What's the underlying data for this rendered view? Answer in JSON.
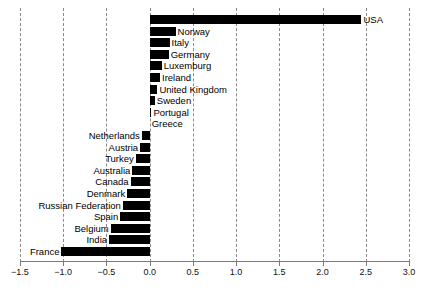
{
  "chart_data": {
    "type": "bar",
    "orientation": "horizontal",
    "title": "",
    "subtitle": "",
    "xlabel": "",
    "ylabel": "",
    "xlim": [
      -1.5,
      3.0
    ],
    "xticks": [
      -1.5,
      -1.0,
      -0.5,
      0.0,
      0.5,
      1.0,
      1.5,
      2.0,
      2.5,
      3.0
    ],
    "xticklabels": [
      "−1.5",
      "−1.0",
      "−0.5",
      "0.0",
      "0.5",
      "1.0",
      "1.5",
      "2.0",
      "2.5",
      "3.0"
    ],
    "grid": true,
    "grid_style": "dashed-vertical",
    "legend": null,
    "bar_color": "#000000",
    "categories": [
      "USA",
      "Norway",
      "Italy",
      "Germany",
      "Luxemburg",
      "Ireland",
      "United Kingdom",
      "Sweden",
      "Portugal",
      "Greece",
      "Netherlands",
      "Austria",
      "Turkey",
      "Australia",
      "Canada",
      "Denmark",
      "Russian Federation",
      "Spain",
      "Belgium",
      "India",
      "France"
    ],
    "values": [
      2.45,
      0.3,
      0.23,
      0.22,
      0.14,
      0.12,
      0.09,
      0.06,
      0.02,
      0.0,
      -0.09,
      -0.11,
      -0.16,
      -0.2,
      -0.22,
      -0.26,
      -0.31,
      -0.34,
      -0.45,
      -0.47,
      -1.02
    ]
  }
}
